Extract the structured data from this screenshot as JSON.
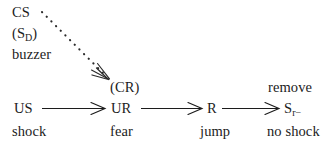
{
  "diagram": {
    "type": "flow-diagram",
    "background_color": "#ffffff",
    "ink_color": "#1c1c1c",
    "stimulus_block": {
      "cs": "CS",
      "sd": "(S",
      "sd_subscript": "D",
      "sd_close": ")",
      "buzzer": "buzzer"
    },
    "annotations": {
      "cr": "(CR)",
      "remove": "remove"
    },
    "chain": {
      "us": "US",
      "ur": "UR",
      "r": "R",
      "sr": "S",
      "sr_subscript": "r−"
    },
    "outcomes": {
      "shock": "shock",
      "fear": "fear",
      "jump": "jump",
      "no_shock": "no shock"
    },
    "arrows": {
      "dotted_diagonal": "dotted-arrow-cs-to-cr",
      "solid_1": "arrow-us-to-ur",
      "solid_2": "arrow-ur-to-r",
      "solid_3": "arrow-r-to-sr"
    }
  }
}
